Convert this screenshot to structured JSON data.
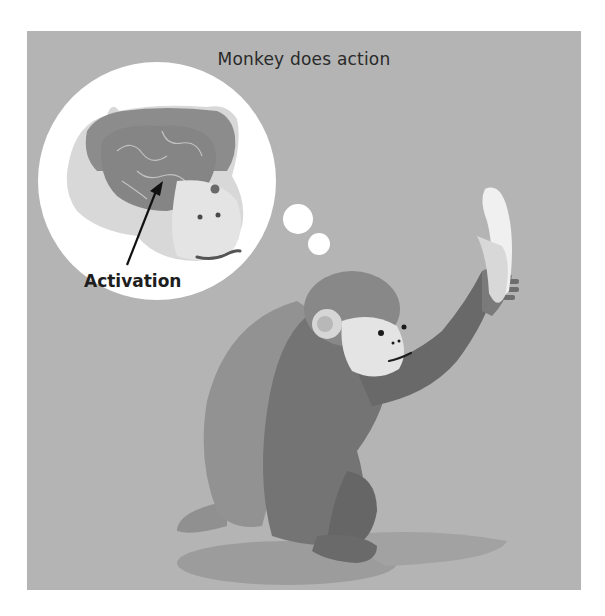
{
  "figure": {
    "title": "Monkey does action",
    "annotation_label": "Activation",
    "colors": {
      "background": "#b4b4b4",
      "border": "#ffffff",
      "thought_bubble": "#ffffff",
      "monkey_fur_light": "#8e8e8e",
      "monkey_fur_dark": "#6e6e6e",
      "monkey_face": "#e6e6e6",
      "brain": "#8a8a8a",
      "banana": "#f2f2f2",
      "shadow": "#9a9a9a",
      "text": "#2a2a2a"
    },
    "elements": [
      "thought-bubble-with-monkey-brain",
      "activation-arrow",
      "monkey-holding-banana",
      "floor-shadow"
    ]
  }
}
